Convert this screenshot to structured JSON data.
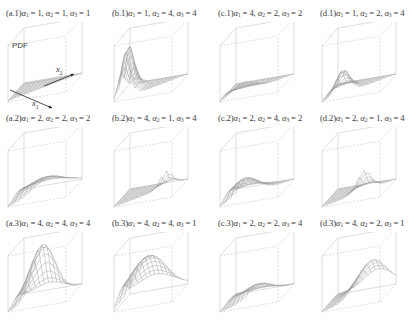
{
  "chart_data": {
    "type": "surface3d",
    "title": "",
    "zlabel": "PDF",
    "xlabel": "x1",
    "ylabel": "x2",
    "grid": "4 columns x 3 rows",
    "panels": [
      {
        "id": "a.1",
        "label": "(a.1)",
        "alpha": [
          1,
          1,
          1
        ],
        "shape": "flat"
      },
      {
        "id": "b.1",
        "label": "(b.1)",
        "alpha": [
          1,
          4,
          4
        ],
        "shape": "peak-left"
      },
      {
        "id": "c.1",
        "label": "(c.1)",
        "alpha": [
          4,
          2,
          2
        ],
        "shape": "low-ridge-front"
      },
      {
        "id": "d.1",
        "label": "(d.1)",
        "alpha": [
          1,
          2,
          4
        ],
        "shape": "peak-left-small"
      },
      {
        "id": "a.2",
        "label": "(a.2)",
        "alpha": [
          2,
          2,
          2
        ],
        "shape": "low-dome"
      },
      {
        "id": "b.2",
        "label": "(b.2)",
        "alpha": [
          4,
          1,
          4
        ],
        "shape": "peak-right"
      },
      {
        "id": "c.2",
        "label": "(c.2)",
        "alpha": [
          2,
          4,
          2
        ],
        "shape": "low-dome-left"
      },
      {
        "id": "d.2",
        "label": "(d.2)",
        "alpha": [
          2,
          1,
          4
        ],
        "shape": "peak-center"
      },
      {
        "id": "a.3",
        "label": "(a.3)",
        "alpha": [
          4,
          4,
          4
        ],
        "shape": "tall-dome"
      },
      {
        "id": "b.3",
        "label": "(b.3)",
        "alpha": [
          4,
          4,
          1
        ],
        "shape": "wide-dome"
      },
      {
        "id": "c.3",
        "label": "(c.3)",
        "alpha": [
          2,
          2,
          4
        ],
        "shape": "small-dome"
      },
      {
        "id": "d.3",
        "label": "(d.3)",
        "alpha": [
          4,
          2,
          1
        ],
        "shape": "wide-dome-right"
      }
    ]
  },
  "panels": [
    {
      "label": "(a.1)",
      "a1": "1",
      "a2": "1",
      "a3": "1"
    },
    {
      "label": "(b.1)",
      "a1": "1",
      "a2": "4",
      "a3": "4"
    },
    {
      "label": "(c.1)",
      "a1": "4",
      "a2": "2",
      "a3": "2"
    },
    {
      "label": "(d.1)",
      "a1": "1",
      "a2": "2",
      "a3": "4"
    },
    {
      "label": "(a.2)",
      "a1": "2",
      "a2": "2",
      "a3": "2"
    },
    {
      "label": "(b.2)",
      "a1": "4",
      "a2": "1",
      "a3": "4"
    },
    {
      "label": "(c.2)",
      "a1": "2",
      "a2": "4",
      "a3": "2"
    },
    {
      "label": "(d.2)",
      "a1": "2",
      "a2": "1",
      "a3": "4"
    },
    {
      "label": "(a.3)",
      "a1": "4",
      "a2": "4",
      "a3": "4"
    },
    {
      "label": "(b.3)",
      "a1": "4",
      "a2": "4",
      "a3": "1"
    },
    {
      "label": "(c.3)",
      "a1": "2",
      "a2": "2",
      "a3": "4"
    },
    {
      "label": "(d.3)",
      "a1": "4",
      "a2": "2",
      "a3": "1"
    }
  ],
  "symbols": {
    "alpha": "α",
    "eq": " = ",
    "sep": ", "
  },
  "axes": {
    "z": "PDF",
    "x1": "x",
    "x1_sub": "1",
    "x2": "x",
    "x2_sub": "2"
  }
}
